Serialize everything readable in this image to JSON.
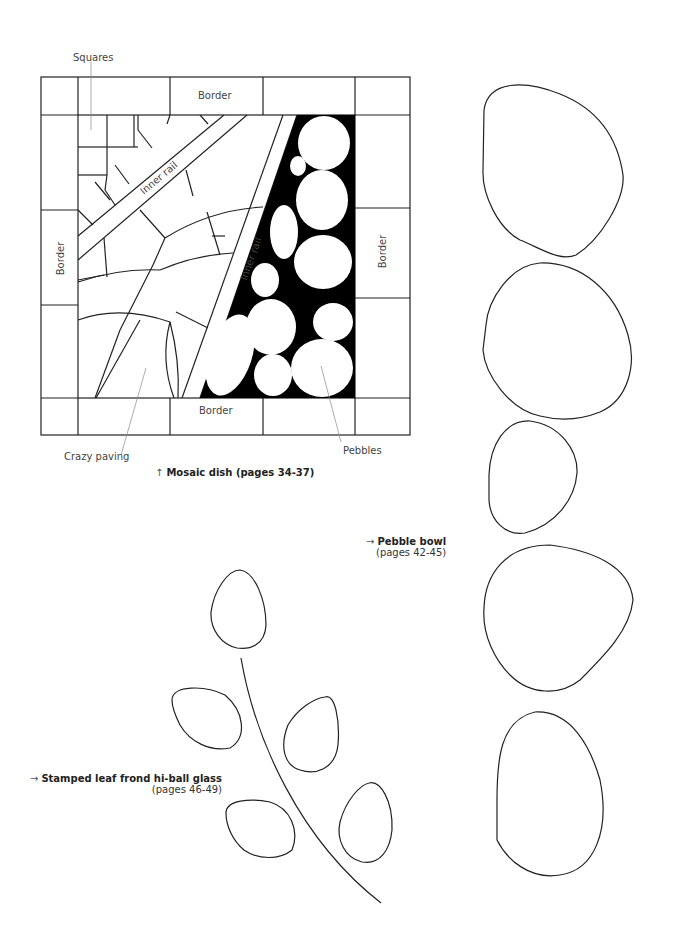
{
  "mosaic_dish": {
    "labels": {
      "squares": "Squares",
      "border_top": "Border",
      "border_bottom": "Border",
      "border_left": "Border",
      "border_right": "Border",
      "inner_rail_1": "Inner rail",
      "inner_rail_2": "Inner rail",
      "crazy_paving": "Crazy paving",
      "pebbles": "Pebbles"
    },
    "caption": {
      "arrow": "↑",
      "text": "Mosaic dish (pages 34-37)"
    }
  },
  "pebble_bowl": {
    "caption": {
      "arrow": "→",
      "title": "Pebble bowl",
      "pages": "(pages 42-45)"
    },
    "pebble_count": 5
  },
  "leaf_frond": {
    "caption": {
      "arrow": "→",
      "title": "Stamped leaf frond hi-ball glass",
      "pages": "(pages 46-49)"
    },
    "leaf_count": 5
  },
  "colors": {
    "line": "#222222",
    "leader_line": "#888888",
    "fill_black": "#000000",
    "background": "#ffffff"
  }
}
